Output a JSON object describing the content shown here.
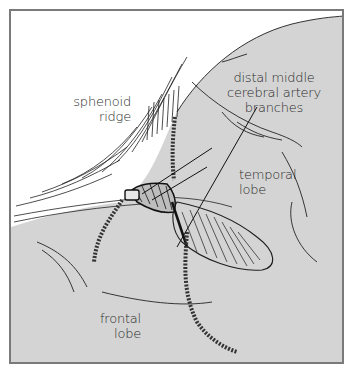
{
  "figure": {
    "type": "anatomical illustration",
    "colors": {
      "background": "#ffffff",
      "tissue": "#d4d4d4",
      "ink": "#1e1e1e",
      "frame": "#7a7a7a"
    },
    "labels": {
      "sphenoid_ridge": {
        "line1": "sphenoid",
        "line2": "ridge"
      },
      "distal_mca": {
        "line1": "distal middle",
        "line2": "cerebral artery",
        "line3": "branches"
      },
      "temporal_lobe": {
        "line1": "temporal",
        "line2": "lobe"
      },
      "frontal_lobe": {
        "line1": "frontal",
        "line2": "lobe"
      }
    }
  }
}
